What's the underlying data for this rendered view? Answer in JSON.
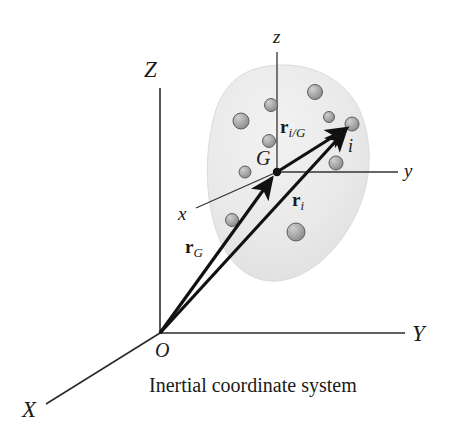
{
  "figure": {
    "caption": "Inertial coordinate system",
    "background_color": "#ffffff",
    "ink_color": "#1a1a1a",
    "body_fill_color": "#e9e9e9",
    "particle_fill_color": "#a9a9a9",
    "particle_stroke_color": "#5a5a5a"
  },
  "axes": {
    "inertial": {
      "name": "inertial-frame",
      "origin_label": "O",
      "origin_point": [
        160,
        333
      ],
      "labels": {
        "z_axis": "Z",
        "y_axis": "Y",
        "x_axis": "X"
      },
      "label_positions": {
        "z_axis": [
          150,
          70
        ],
        "y_axis": [
          417,
          334
        ],
        "x_axis": [
          28,
          410
        ],
        "origin": [
          160,
          354
        ]
      }
    },
    "body": {
      "name": "body-fixed-frame",
      "labels": {
        "z_axis": "z",
        "y_axis": "y",
        "x_axis": "x"
      },
      "label_positions": {
        "z_axis": [
          277,
          38
        ],
        "y_axis": [
          408,
          171
        ],
        "x_axis": [
          183,
          214
        ]
      }
    }
  },
  "points": {
    "G": {
      "label": "G",
      "label_position": [
        261,
        159
      ],
      "coords": [
        277,
        172
      ]
    },
    "i": {
      "label": "i",
      "label_position": [
        350,
        149
      ],
      "coords": [
        352,
        124
      ]
    }
  },
  "vectors": [
    {
      "name": "r-G",
      "symbol": "r",
      "subscript": "G",
      "from": [
        160,
        333
      ],
      "to": [
        277,
        172
      ],
      "label_position": [
        196,
        248
      ]
    },
    {
      "name": "r-i",
      "symbol": "r",
      "subscript": "i",
      "from": [
        160,
        333
      ],
      "to": [
        352,
        124
      ],
      "label_position": [
        298,
        201
      ]
    },
    {
      "name": "r-i-over-G",
      "symbol": "r",
      "subscript": "i/G",
      "from": [
        277,
        172
      ],
      "to": [
        352,
        124
      ],
      "label_position": [
        289,
        128
      ]
    }
  ],
  "particles": [
    {
      "cx": 315,
      "cy": 92,
      "r": 7.5
    },
    {
      "cx": 271,
      "cy": 105,
      "r": 6.5
    },
    {
      "cx": 329,
      "cy": 117,
      "r": 5.5
    },
    {
      "cx": 352,
      "cy": 124,
      "r": 7.0
    },
    {
      "cx": 241,
      "cy": 121,
      "r": 8.0
    },
    {
      "cx": 269,
      "cy": 141,
      "r": 6.5
    },
    {
      "cx": 336,
      "cy": 163,
      "r": 7.0
    },
    {
      "cx": 245,
      "cy": 172,
      "r": 6.0
    },
    {
      "cx": 232,
      "cy": 220,
      "r": 6.5
    },
    {
      "cx": 296,
      "cy": 232,
      "r": 9.0
    }
  ],
  "body_outline_description": "blob"
}
